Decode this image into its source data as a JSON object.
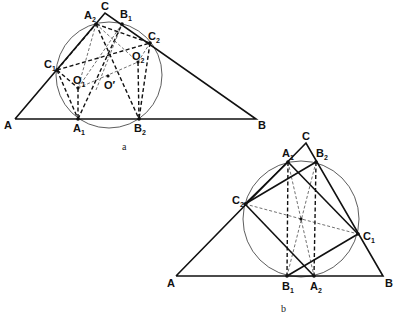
{
  "figures": [
    {
      "id": "a",
      "caption": "a",
      "labels": {
        "A": "A",
        "B": "B",
        "C": "C",
        "A1": "A",
        "A1_sub": "1",
        "A2": "A",
        "A2_sub": "2",
        "B1": "B",
        "B1_sub": "1",
        "B2": "B",
        "B2_sub": "2",
        "C1": "C",
        "C1_sub": "1",
        "C2": "C",
        "C2_sub": "2",
        "O1": "O",
        "O1_sub": "1",
        "O2": "O",
        "O2_sub": "2",
        "Oprime": "O′"
      }
    },
    {
      "id": "b",
      "caption": "b",
      "labels": {
        "A": "A",
        "B": "B",
        "C": "C",
        "A1": "A",
        "A1_sub": "1",
        "A2": "A",
        "A2_sub": "2",
        "B1": "B",
        "B1_sub": "1",
        "B2": "B",
        "B2_sub": "2",
        "C1": "C",
        "C1_sub": "1",
        "C2": "C",
        "C2_sub": "2"
      }
    }
  ]
}
